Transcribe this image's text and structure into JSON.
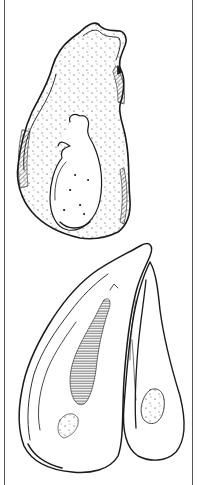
{
  "illustration": {
    "subject": "oyster shells line drawing",
    "items": [
      {
        "name": "upper-oyster-shell",
        "view": "exterior single valve"
      },
      {
        "name": "lower-oyster-pair",
        "view": "two valves side by side"
      }
    ],
    "colors": {
      "ink": "#1a1a1a",
      "paper": "#ffffff",
      "frame": "#555555"
    }
  }
}
